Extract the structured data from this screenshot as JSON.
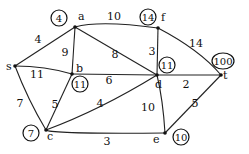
{
  "graph": {
    "nodes": [
      {
        "id": "s",
        "label": "s",
        "x": 15,
        "y": 66,
        "lx": 6,
        "ly": 70
      },
      {
        "id": "a",
        "label": "a",
        "x": 75,
        "y": 27,
        "lx": 78,
        "ly": 20,
        "dist": "4",
        "dx": 59,
        "dy": 18
      },
      {
        "id": "f",
        "label": "f",
        "x": 158,
        "y": 28,
        "lx": 161,
        "ly": 21,
        "dist": "14",
        "dx": 148,
        "dy": 17
      },
      {
        "id": "b",
        "label": "b",
        "x": 72,
        "y": 74,
        "lx": 76,
        "ly": 72,
        "dist": "11",
        "dx": 80,
        "dy": 84
      },
      {
        "id": "d",
        "label": "d",
        "x": 157,
        "y": 75,
        "lx": 155,
        "ly": 88,
        "dist": "11",
        "dx": 167,
        "dy": 65
      },
      {
        "id": "t",
        "label": "t",
        "x": 221,
        "y": 75,
        "lx": 223,
        "ly": 79,
        "dist": "100",
        "dx": 223,
        "dy": 61
      },
      {
        "id": "c",
        "label": "c",
        "x": 46,
        "y": 130,
        "lx": 47,
        "ly": 140,
        "dist": "7",
        "dx": 31,
        "dy": 133
      },
      {
        "id": "e",
        "label": "e",
        "x": 165,
        "y": 133,
        "lx": 153,
        "ly": 143,
        "dist": "10",
        "dx": 181,
        "dy": 137
      }
    ],
    "edges": [
      {
        "from": "s",
        "to": "a",
        "weight": "4",
        "path": "M15,66 L75,27",
        "wx": 38,
        "wy": 43
      },
      {
        "from": "s",
        "to": "b",
        "weight": "11",
        "path": "M15,66 Q45,66 72,74",
        "wx": 37,
        "wy": 78
      },
      {
        "from": "s",
        "to": "c",
        "weight": "7",
        "path": "M15,66 Q28,100 46,130",
        "wx": 20,
        "wy": 107
      },
      {
        "from": "a",
        "to": "f",
        "weight": "10",
        "path": "M75,27 Q100,20 158,28",
        "wx": 114,
        "wy": 20
      },
      {
        "from": "a",
        "to": "b",
        "weight": "9",
        "path": "M75,27 L72,74",
        "wx": 65,
        "wy": 56
      },
      {
        "from": "a",
        "to": "d",
        "weight": "8",
        "path": "M75,27 L157,75",
        "wx": 115,
        "wy": 58
      },
      {
        "from": "f",
        "to": "d",
        "weight": "3",
        "path": "M158,28 L157,75",
        "wx": 152,
        "wy": 55
      },
      {
        "from": "f",
        "to": "t",
        "weight": "14",
        "path": "M158,28 Q200,50 221,75",
        "wx": 196,
        "wy": 47
      },
      {
        "from": "b",
        "to": "d",
        "weight": "6",
        "path": "M72,74 L157,75",
        "wx": 109,
        "wy": 84
      },
      {
        "from": "d",
        "to": "t",
        "weight": "2",
        "path": "M157,75 L221,75",
        "wx": 186,
        "wy": 88
      },
      {
        "from": "c",
        "to": "b",
        "weight": "5",
        "path": "M46,130 Q60,100 72,74",
        "wx": 55,
        "wy": 108
      },
      {
        "from": "c",
        "to": "d",
        "weight": "4",
        "path": "M46,130 Q100,110 157,75",
        "wx": 100,
        "wy": 107
      },
      {
        "from": "c",
        "to": "e",
        "weight": "3",
        "path": "M46,130 Q50,134 165,133",
        "wx": 107,
        "wy": 145
      },
      {
        "from": "d",
        "to": "e",
        "weight": "10",
        "path": "M157,75 Q163,100 165,133",
        "wx": 148,
        "wy": 111
      },
      {
        "from": "e",
        "to": "t",
        "weight": "5",
        "path": "M165,133 L221,75",
        "wx": 195,
        "wy": 107
      }
    ]
  }
}
